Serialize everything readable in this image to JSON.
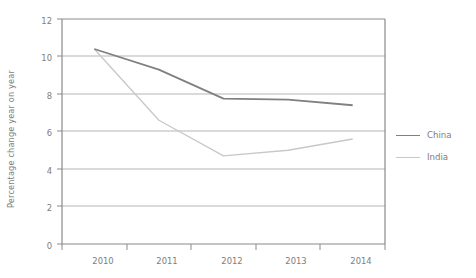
{
  "chart_data": {
    "type": "line",
    "title": "",
    "subtitle": "",
    "xlabel": "",
    "ylabel": "Percentage change year on year",
    "x": [
      "2010",
      "2011",
      "2012",
      "2013",
      "2014"
    ],
    "categories": [
      "2010",
      "2011",
      "2012",
      "2013",
      "2014"
    ],
    "series": [
      {
        "name": "China",
        "color": "#808080",
        "values": [
          10.4,
          9.3,
          7.75,
          7.7,
          7.4
        ]
      },
      {
        "name": "India",
        "color": "#c8c8c8",
        "values": [
          10.4,
          6.6,
          4.7,
          5.0,
          5.6
        ]
      }
    ],
    "ylim": [
      0,
      12
    ],
    "y_ticks": [
      "0",
      "2",
      "4",
      "6",
      "8",
      "10",
      "12"
    ],
    "y_tick_values": [
      0,
      2,
      4,
      6,
      8,
      10,
      12
    ],
    "grid": "horizontal",
    "legend_position": "right",
    "annotations": []
  },
  "legend": {
    "entries": [
      {
        "label": "China",
        "color": "#808080"
      },
      {
        "label": "India",
        "color": "#c8c8c8"
      }
    ]
  },
  "axes": {
    "y_title": "Percentage change year on year",
    "y_labels": [
      "12",
      "10",
      "8",
      "6",
      "4",
      "2",
      "0"
    ],
    "x_labels": [
      "2010",
      "2011",
      "2012",
      "2013",
      "2014"
    ]
  },
  "colors": {
    "china_line": "#808080",
    "india_line": "#c8c8c8",
    "gridline": "#b5b5b5",
    "axis": "#8a8a8a",
    "text": "#7d7d7d",
    "background": "#ffffff"
  }
}
